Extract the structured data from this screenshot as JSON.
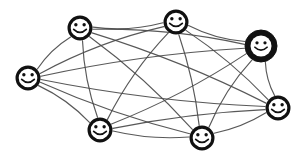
{
  "scene": {
    "title": "Smiley Network Diagram",
    "background_color": "#ffffff",
    "width": 301,
    "height": 160
  },
  "style": {
    "edge_color": "#4a4a4a",
    "node_outline_color": "#111111",
    "node_fill_color": "#ffffff",
    "highlight_fill_color": "#111111",
    "face_color": "#111111"
  },
  "graph": {
    "kind": "complete-graph",
    "node_count": 7,
    "edge_count": 21,
    "nodes": [
      {
        "id": "n1",
        "label": "smiley-top-left",
        "x": 80,
        "y": 28,
        "r": 12.5,
        "highlighted": false
      },
      {
        "id": "n2",
        "label": "smiley-top-center",
        "x": 176,
        "y": 22,
        "r": 12.5,
        "highlighted": false
      },
      {
        "id": "n3",
        "label": "smiley-top-right",
        "x": 261,
        "y": 46,
        "r": 16.0,
        "highlighted": true
      },
      {
        "id": "n4",
        "label": "smiley-left",
        "x": 28,
        "y": 78,
        "r": 12.5,
        "highlighted": false
      },
      {
        "id": "n5",
        "label": "smiley-right",
        "x": 278,
        "y": 108,
        "r": 12.5,
        "highlighted": false
      },
      {
        "id": "n6",
        "label": "smiley-bottom-left",
        "x": 100,
        "y": 130,
        "r": 12.5,
        "highlighted": false
      },
      {
        "id": "n7",
        "label": "smiley-bottom-center",
        "x": 202,
        "y": 138,
        "r": 12.5,
        "highlighted": false
      }
    ],
    "edges": [
      {
        "from": "n1",
        "to": "n2",
        "curve": 7
      },
      {
        "from": "n1",
        "to": "n3",
        "curve": -9
      },
      {
        "from": "n1",
        "to": "n4",
        "curve": 5
      },
      {
        "from": "n1",
        "to": "n5",
        "curve": -8
      },
      {
        "from": "n1",
        "to": "n6",
        "curve": 6
      },
      {
        "from": "n1",
        "to": "n7",
        "curve": -7
      },
      {
        "from": "n2",
        "to": "n3",
        "curve": 6
      },
      {
        "from": "n2",
        "to": "n4",
        "curve": 9
      },
      {
        "from": "n2",
        "to": "n5",
        "curve": -6
      },
      {
        "from": "n2",
        "to": "n6",
        "curve": 8
      },
      {
        "from": "n2",
        "to": "n7",
        "curve": -5
      },
      {
        "from": "n3",
        "to": "n4",
        "curve": 8
      },
      {
        "from": "n3",
        "to": "n5",
        "curve": 4
      },
      {
        "from": "n3",
        "to": "n6",
        "curve": -8
      },
      {
        "from": "n3",
        "to": "n7",
        "curve": 7
      },
      {
        "from": "n4",
        "to": "n5",
        "curve": 9
      },
      {
        "from": "n4",
        "to": "n6",
        "curve": -6
      },
      {
        "from": "n4",
        "to": "n7",
        "curve": 7
      },
      {
        "from": "n5",
        "to": "n6",
        "curve": 6
      },
      {
        "from": "n5",
        "to": "n7",
        "curve": -5
      },
      {
        "from": "n6",
        "to": "n7",
        "curve": 6
      }
    ]
  }
}
